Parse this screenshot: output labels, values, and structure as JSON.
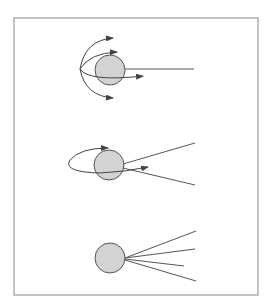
{
  "diagram": {
    "title": "",
    "panels": [
      {
        "id": "panel-1",
        "description": "Sphere with a straight line extending right; multiple curved arrows fan out from a point to the left of the sphere",
        "arrow_count": 4,
        "line_count": 1
      },
      {
        "id": "panel-2",
        "description": "Sphere with an elliptical loop arrow wrapping around it and two diverging lines to the right",
        "arrow_count": 2,
        "line_count": 2
      },
      {
        "id": "panel-3",
        "description": "Sphere with four straight lines radiating to the right",
        "arrow_count": 0,
        "line_count": 4
      }
    ],
    "colors": {
      "sphere_fill": "#d3d3d3",
      "stroke": "#555555",
      "frame": "#9a9a9a"
    }
  }
}
